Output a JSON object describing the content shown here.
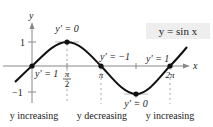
{
  "figure": {
    "function_label": "y = sin x",
    "axis_labels": {
      "x": "x",
      "y": "y"
    },
    "y_ticks": [
      "1",
      "−1"
    ],
    "x_ticks": [
      "π/2",
      "π",
      "2π"
    ],
    "x_ticks_parts": {
      "half_pi_num": "π",
      "half_pi_den": "2",
      "pi": "π",
      "two_pi": "2π"
    },
    "derivative_annotations": [
      {
        "at": "0",
        "text": "y′ = 1"
      },
      {
        "at": "π/2",
        "text": "y′ = 0"
      },
      {
        "at": "π",
        "text": "y′ = −1"
      },
      {
        "at": "3π/2",
        "text": "y′ = 0"
      },
      {
        "at": "2π",
        "text": "y′ = 1"
      }
    ],
    "intervals": [
      {
        "text": "y increasing"
      },
      {
        "text": "y decreasing"
      },
      {
        "text": "y increasing"
      }
    ],
    "colors": {
      "curve": "#111111",
      "axis": "#888888",
      "tangent": "#bbbbbb",
      "label_box": "#eeeeee"
    }
  }
}
